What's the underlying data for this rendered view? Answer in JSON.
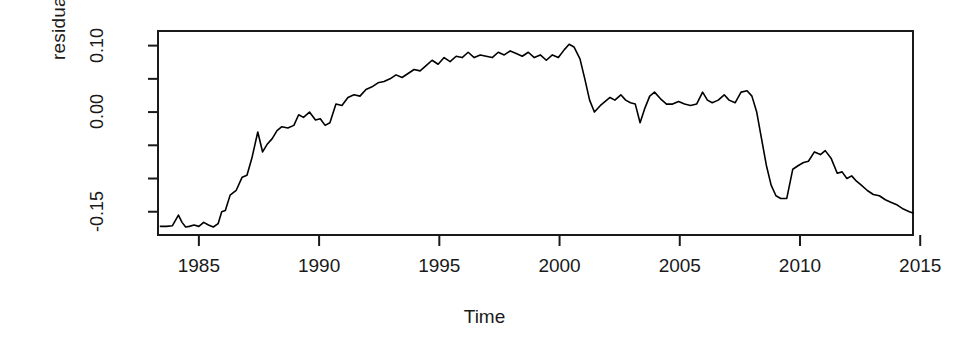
{
  "chart_data": {
    "type": "line",
    "title": "",
    "xlabel": "Time",
    "ylabel": "residual.ts",
    "xlim": [
      1983.5,
      1984.0
    ],
    "x_range": [
      1983.3,
      2014.7
    ],
    "ylim": [
      -0.185,
      0.122
    ],
    "grid": false,
    "legend": null,
    "xtick_labels": [
      "1985",
      "1990",
      "1995",
      "2000",
      "2005",
      "2010",
      "2015"
    ],
    "xtick_values": [
      1985,
      1990,
      1995,
      2000,
      2005,
      2010,
      2015
    ],
    "ytick_labels": [
      "0.10",
      "",
      "0.00",
      "",
      "",
      "-0.15"
    ],
    "ytick_values": [
      0.1,
      0.05,
      0.0,
      -0.05,
      -0.1,
      -0.15
    ],
    "series_name": "residual.ts",
    "line_color": "#000000",
    "x": [
      1983.4,
      1983.65,
      1983.9,
      1984.15,
      1984.3,
      1984.45,
      1984.6,
      1984.8,
      1985.0,
      1985.2,
      1985.4,
      1985.6,
      1985.8,
      1985.95,
      1986.1,
      1986.3,
      1986.55,
      1986.8,
      1987.0,
      1987.2,
      1987.45,
      1987.65,
      1987.85,
      1988.05,
      1988.25,
      1988.45,
      1988.7,
      1988.95,
      1989.15,
      1989.35,
      1989.6,
      1989.85,
      1990.05,
      1990.25,
      1990.45,
      1990.7,
      1990.95,
      1991.2,
      1991.45,
      1991.7,
      1991.95,
      1992.2,
      1992.45,
      1992.7,
      1992.95,
      1993.2,
      1993.45,
      1993.7,
      1993.95,
      1994.2,
      1994.45,
      1994.7,
      1994.95,
      1995.2,
      1995.45,
      1995.7,
      1995.95,
      1996.2,
      1996.45,
      1996.7,
      1996.95,
      1997.2,
      1997.45,
      1997.7,
      1997.95,
      1998.2,
      1998.45,
      1998.7,
      1998.95,
      1999.2,
      1999.45,
      1999.7,
      1999.95,
      2000.2,
      2000.4,
      2000.6,
      2000.85,
      2001.05,
      2001.25,
      2001.45,
      2001.7,
      2001.9,
      2002.1,
      2002.3,
      2002.55,
      2002.75,
      2002.95,
      2003.15,
      2003.35,
      2003.55,
      2003.75,
      2003.95,
      2004.2,
      2004.45,
      2004.7,
      2004.95,
      2005.2,
      2005.45,
      2005.7,
      2005.95,
      2006.15,
      2006.35,
      2006.6,
      2006.85,
      2007.05,
      2007.3,
      2007.55,
      2007.8,
      2008.0,
      2008.2,
      2008.4,
      2008.6,
      2008.8,
      2009.0,
      2009.2,
      2009.45,
      2009.7,
      2009.95,
      2010.15,
      2010.35,
      2010.6,
      2010.85,
      2011.05,
      2011.3,
      2011.55,
      2011.75,
      2011.95,
      2012.15,
      2012.35,
      2012.55,
      2012.8,
      2013.05,
      2013.3,
      2013.55,
      2013.8,
      2014.05,
      2014.3,
      2014.55,
      2014.7
    ],
    "y": [
      -0.172,
      -0.172,
      -0.171,
      -0.155,
      -0.166,
      -0.173,
      -0.172,
      -0.17,
      -0.172,
      -0.166,
      -0.17,
      -0.173,
      -0.168,
      -0.15,
      -0.148,
      -0.125,
      -0.118,
      -0.098,
      -0.095,
      -0.07,
      -0.03,
      -0.06,
      -0.048,
      -0.04,
      -0.028,
      -0.022,
      -0.024,
      -0.02,
      -0.004,
      -0.008,
      0.0,
      -0.012,
      -0.01,
      -0.02,
      -0.016,
      0.012,
      0.01,
      0.022,
      0.026,
      0.024,
      0.034,
      0.038,
      0.044,
      0.046,
      0.05,
      0.056,
      0.052,
      0.058,
      0.064,
      0.062,
      0.07,
      0.078,
      0.072,
      0.082,
      0.076,
      0.084,
      0.082,
      0.09,
      0.082,
      0.086,
      0.084,
      0.082,
      0.09,
      0.086,
      0.092,
      0.088,
      0.084,
      0.09,
      0.082,
      0.086,
      0.078,
      0.086,
      0.082,
      0.094,
      0.102,
      0.098,
      0.08,
      0.05,
      0.018,
      0.0,
      0.01,
      0.016,
      0.022,
      0.018,
      0.026,
      0.018,
      0.014,
      0.012,
      -0.016,
      0.006,
      0.024,
      0.03,
      0.02,
      0.012,
      0.012,
      0.016,
      0.012,
      0.01,
      0.012,
      0.03,
      0.018,
      0.014,
      0.018,
      0.026,
      0.018,
      0.014,
      0.03,
      0.032,
      0.024,
      0.0,
      -0.04,
      -0.08,
      -0.11,
      -0.126,
      -0.13,
      -0.13,
      -0.086,
      -0.08,
      -0.076,
      -0.074,
      -0.06,
      -0.064,
      -0.058,
      -0.07,
      -0.092,
      -0.09,
      -0.1,
      -0.096,
      -0.104,
      -0.11,
      -0.118,
      -0.124,
      -0.126,
      -0.132,
      -0.136,
      -0.14,
      -0.146,
      -0.15,
      -0.152
    ]
  },
  "plot": {
    "box_left": 158,
    "box_right": 913,
    "box_top": 31,
    "box_bottom": 235
  }
}
